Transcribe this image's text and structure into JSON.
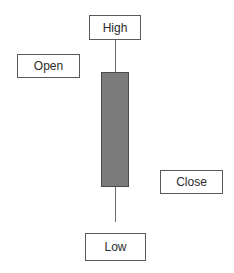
{
  "diagram": {
    "title": "",
    "type": "candlestick-anatomy",
    "labels": {
      "high": "High",
      "open": "Open",
      "close": "Close",
      "low": "Low"
    },
    "colors": {
      "body_fill": "#7b7b7b",
      "body_border": "#4a4a4a",
      "wick": "#6a6a6a",
      "box_border": "#5a5a5a",
      "text": "#2a2a2a"
    }
  }
}
